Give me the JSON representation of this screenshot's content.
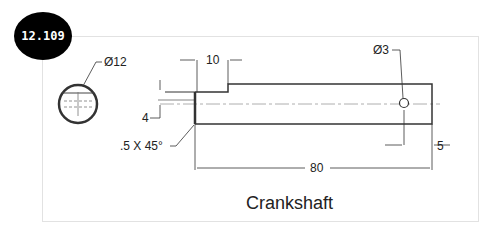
{
  "badge": {
    "label": "12.109"
  },
  "drawing": {
    "title": "Crankshaft",
    "dimensions": {
      "end_view_diameter": "Ø12",
      "step_length": "10",
      "step_height": "4",
      "chamfer": ".5 X 45°",
      "hole_diameter": "Ø3",
      "hole_offset": "5",
      "overall_length": "80"
    }
  },
  "colors": {
    "line": "#333333",
    "badge_bg": "#000000",
    "badge_text": "#ffffff"
  }
}
